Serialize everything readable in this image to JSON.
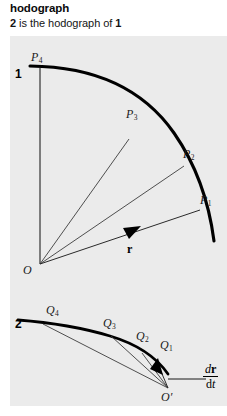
{
  "header": {
    "title": "hodograph",
    "subtitle_pre": "",
    "subtitle_bold_1": "2",
    "subtitle_mid": " is the hodograph of ",
    "subtitle_bold_2": "1"
  },
  "figure": {
    "panel_background": "#ebebeb",
    "ink_color": "#000000",
    "thin_line_color": "#4a4a4a",
    "diagram1": {
      "index_label": "1",
      "origin_label": "O",
      "vector_label": "r",
      "point_labels": [
        "P1",
        "P2",
        "P3",
        "P4"
      ],
      "p1_label": "P",
      "p1_sub": "1",
      "p2_label": "P",
      "p2_sub": "2",
      "p3_label": "P",
      "p3_sub": "3",
      "p4_label": "P",
      "p4_sub": "4"
    },
    "diagram2": {
      "index_label": "2",
      "origin_label": "O′",
      "point_labels": [
        "Q1",
        "Q2",
        "Q3",
        "Q4"
      ],
      "q1_label": "Q",
      "q1_sub": "1",
      "q2_label": "Q",
      "q2_sub": "2",
      "q3_label": "Q",
      "q3_sub": "3",
      "q4_label": "Q",
      "q4_sub": "4",
      "derivative_numerator_d": "d",
      "derivative_numerator_r": "r",
      "derivative_denominator_d": "d",
      "derivative_denominator_t": "t"
    }
  }
}
